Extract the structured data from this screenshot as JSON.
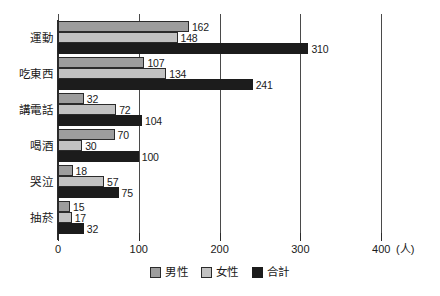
{
  "chart_data": {
    "type": "bar",
    "orientation": "horizontal",
    "title": "",
    "xlabel": "(人)",
    "ylabel": "",
    "xlim": [
      0,
      420
    ],
    "xticks": [
      0,
      100,
      200,
      300,
      400
    ],
    "xtick_labels": [
      "0",
      "100",
      "200",
      "300",
      "400"
    ],
    "unit_label": "(人)",
    "grid": "vertical-at-ticks",
    "legend_position": "bottom-center",
    "categories": [
      "運動",
      "吃東西",
      "講電話",
      "喝酒",
      "哭泣",
      "抽菸"
    ],
    "series": [
      {
        "name": "男性",
        "color": "#9d9d9d",
        "values": [
          162,
          107,
          32,
          70,
          18,
          15
        ]
      },
      {
        "name": "女性",
        "color": "#c2c2c2",
        "values": [
          148,
          134,
          72,
          30,
          57,
          17
        ]
      },
      {
        "name": "合計",
        "color": "#1c1c1c",
        "values": [
          310,
          241,
          104,
          100,
          75,
          32
        ]
      }
    ]
  },
  "legend": {
    "items": [
      {
        "label": "男性",
        "swatch": "male-swatch"
      },
      {
        "label": "女性",
        "swatch": "female-swatch"
      },
      {
        "label": "合計",
        "swatch": "total-swatch"
      }
    ]
  },
  "axis": {
    "x_unit": "(人)",
    "tick_labels": [
      "0",
      "100",
      "200",
      "300",
      "400"
    ]
  }
}
